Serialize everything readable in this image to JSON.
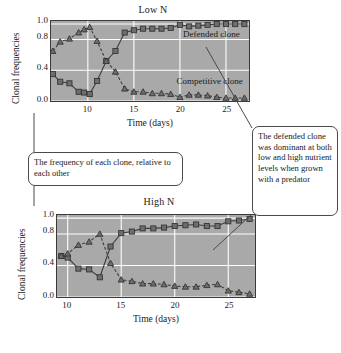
{
  "figure": {
    "callout_left": "The frequency of each clone, relative to each other",
    "callout_right": "The defended clone was dominant at both low and high nutrient levels when grown with a predator"
  },
  "chart_data": [
    {
      "type": "line",
      "id": "low-n",
      "title": "Low N",
      "xlabel": "Time (days)",
      "ylabel": "Clonal frequencies",
      "xlim": [
        6,
        27.5
      ],
      "ylim": [
        0.0,
        1.04
      ],
      "xticks": [
        10,
        15,
        20,
        25
      ],
      "yticks": [
        0.0,
        0.4,
        0.8,
        1.0
      ],
      "ytick_labels": [
        "0.0",
        "0.4",
        "0.8",
        "1.0"
      ],
      "grid": true,
      "legend": "in-plot annotations",
      "annotations": [
        {
          "text": "Defended clone",
          "x": 20.3,
          "y": 0.86
        },
        {
          "text": "Competitive clone",
          "x": 19.6,
          "y": 0.27
        }
      ],
      "series": [
        {
          "name": "Defended clone",
          "marker": "square",
          "line": "solid",
          "color": "#6e6e6e",
          "x": [
            6.2,
            7.0,
            8.0,
            9.0,
            9.6,
            10.2,
            11.0,
            12.0,
            13.0,
            14.0,
            15.0,
            16.0,
            17.0,
            18.0,
            19.0,
            20.0,
            21.0,
            22.0,
            23.0,
            24.0,
            25.0,
            26.0,
            27.0
          ],
          "y": [
            0.35,
            0.25,
            0.23,
            0.12,
            0.11,
            0.09,
            0.26,
            0.52,
            0.65,
            0.89,
            0.92,
            0.94,
            0.94,
            0.94,
            0.95,
            0.99,
            0.97,
            0.98,
            0.99,
            1.0,
            1.0,
            1.0,
            1.0
          ]
        },
        {
          "name": "Competitive clone",
          "marker": "triangle",
          "line": "dashed",
          "color": "#6e6e6e",
          "x": [
            6.2,
            7.0,
            8.0,
            9.0,
            9.6,
            10.2,
            11.0,
            12.0,
            13.0,
            14.0,
            15.0,
            16.0,
            17.0,
            18.0,
            19.0,
            20.0,
            21.0,
            22.0,
            23.0,
            24.0,
            25.0,
            26.0,
            27.0
          ],
          "y": [
            0.65,
            0.77,
            0.81,
            0.89,
            0.93,
            0.96,
            0.78,
            0.52,
            0.38,
            0.16,
            0.12,
            0.12,
            0.1,
            0.1,
            0.09,
            0.05,
            0.08,
            0.08,
            0.07,
            0.05,
            0.04,
            0.04,
            0.04
          ]
        }
      ]
    },
    {
      "type": "line",
      "id": "high-n",
      "title": "High N",
      "xlabel": "Time (days)",
      "ylabel": "Clonal frequencies",
      "xlim": [
        9,
        27.5
      ],
      "ylim": [
        0.0,
        1.04
      ],
      "xticks": [
        10,
        15,
        20,
        25
      ],
      "yticks": [
        0.0,
        0.4,
        0.8,
        1.0
      ],
      "ytick_labels": [
        "0.0",
        "0.4",
        "0.8",
        "1.0"
      ],
      "grid": true,
      "series": [
        {
          "name": "Defended clone",
          "marker": "square",
          "line": "solid",
          "color": "#6e6e6e",
          "x": [
            9.4,
            10.0,
            11.0,
            12.0,
            13.0,
            14.0,
            15.0,
            16.0,
            17.0,
            18.0,
            19.0,
            20.0,
            21.0,
            22.0,
            23.0,
            24.0,
            25.0,
            26.0,
            27.0
          ],
          "y": [
            0.52,
            0.5,
            0.36,
            0.35,
            0.25,
            0.64,
            0.81,
            0.83,
            0.87,
            0.87,
            0.88,
            0.9,
            0.91,
            0.92,
            0.9,
            0.9,
            0.96,
            0.97,
            0.99
          ]
        },
        {
          "name": "Competitive clone",
          "marker": "triangle",
          "line": "dashed",
          "color": "#6e6e6e",
          "x": [
            9.4,
            10.0,
            11.0,
            12.0,
            13.0,
            14.0,
            15.0,
            16.0,
            17.0,
            18.0,
            19.0,
            20.0,
            21.0,
            22.0,
            23.0,
            24.0,
            25.0,
            26.0,
            27.0
          ],
          "y": [
            0.52,
            0.55,
            0.66,
            0.7,
            0.8,
            0.43,
            0.22,
            0.2,
            0.17,
            0.17,
            0.16,
            0.14,
            0.13,
            0.13,
            0.15,
            0.16,
            0.08,
            0.06,
            0.04
          ]
        }
      ]
    }
  ]
}
